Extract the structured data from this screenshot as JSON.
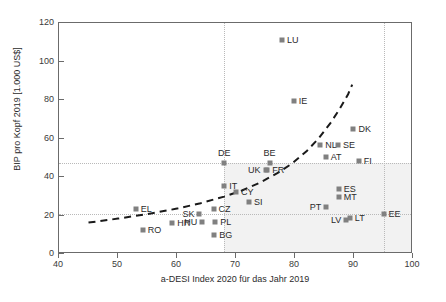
{
  "chart_data": {
    "type": "scatter",
    "title": "",
    "xlabel": "a-DESI Index 2020 für das Jahr 2019",
    "ylabel": "BIP pro Kopf 2019 [1.000 US$]",
    "xlim": [
      40,
      100
    ],
    "ylim": [
      0,
      120
    ],
    "xticks": [
      40,
      50,
      60,
      70,
      80,
      90,
      100
    ],
    "yticks": [
      0,
      20,
      40,
      60,
      80,
      100,
      120
    ],
    "grid": "dotted reference lines at x=68, x=95, y=21, y=47.5",
    "legend": "none",
    "marker_color": "#808080",
    "points": [
      {
        "label": "EL",
        "x": 53.0,
        "y": 23.5,
        "lx": 1,
        "ly": 0,
        "anchor": "right"
      },
      {
        "label": "RO",
        "x": 54.2,
        "y": 12.5,
        "lx": 1,
        "ly": 0,
        "anchor": "right"
      },
      {
        "label": "HR",
        "x": 59.2,
        "y": 16.0,
        "lx": 1,
        "ly": 0,
        "anchor": "right"
      },
      {
        "label": "SK",
        "x": 63.8,
        "y": 20.8,
        "lx": -1,
        "ly": 0,
        "anchor": "left"
      },
      {
        "label": "HU",
        "x": 64.3,
        "y": 16.8,
        "lx": -1,
        "ly": 0,
        "anchor": "left"
      },
      {
        "label": "CZ",
        "x": 66.2,
        "y": 23.5,
        "lx": 1,
        "ly": 0,
        "anchor": "right"
      },
      {
        "label": "PL",
        "x": 66.5,
        "y": 16.8,
        "lx": 1,
        "ly": 0,
        "anchor": "right"
      },
      {
        "label": "BG",
        "x": 66.3,
        "y": 9.8,
        "lx": 1,
        "ly": 0,
        "anchor": "right"
      },
      {
        "label": "DE",
        "x": 68.0,
        "y": 47.5,
        "lx": 0,
        "ly": -1,
        "anchor": "above"
      },
      {
        "label": "IT",
        "x": 68.0,
        "y": 35.5,
        "lx": 1,
        "ly": 0,
        "anchor": "right"
      },
      {
        "label": "CY",
        "x": 70.0,
        "y": 32.0,
        "lx": 1,
        "ly": 0,
        "anchor": "right"
      },
      {
        "label": "SI",
        "x": 72.2,
        "y": 27.0,
        "lx": 1,
        "ly": 0,
        "anchor": "right"
      },
      {
        "label": "UK",
        "x": 75.0,
        "y": 43.5,
        "lx": -1,
        "ly": 0,
        "anchor": "left"
      },
      {
        "label": "FR",
        "x": 75.3,
        "y": 43.5,
        "lx": 1,
        "ly": 0,
        "anchor": "right"
      },
      {
        "label": "BE",
        "x": 75.7,
        "y": 47.5,
        "lx": 0,
        "ly": -1,
        "anchor": "above"
      },
      {
        "label": "LU",
        "x": 77.8,
        "y": 111.0,
        "lx": 1,
        "ly": 0,
        "anchor": "right"
      },
      {
        "label": "IE",
        "x": 79.8,
        "y": 79.5,
        "lx": 1,
        "ly": 0,
        "anchor": "right"
      },
      {
        "label": "NL",
        "x": 84.3,
        "y": 56.5,
        "lx": 1,
        "ly": 0,
        "anchor": "right"
      },
      {
        "label": "AT",
        "x": 85.2,
        "y": 50.5,
        "lx": 1,
        "ly": 0,
        "anchor": "right"
      },
      {
        "label": "PT",
        "x": 85.3,
        "y": 24.5,
        "lx": -1,
        "ly": 0,
        "anchor": "left"
      },
      {
        "label": "SE",
        "x": 87.3,
        "y": 56.5,
        "lx": 1,
        "ly": 0,
        "anchor": "right"
      },
      {
        "label": "ES",
        "x": 87.4,
        "y": 34.0,
        "lx": 1,
        "ly": 0,
        "anchor": "right"
      },
      {
        "label": "MT",
        "x": 87.4,
        "y": 29.5,
        "lx": 1,
        "ly": 0,
        "anchor": "right"
      },
      {
        "label": "LV",
        "x": 88.7,
        "y": 17.5,
        "lx": -1,
        "ly": 0,
        "anchor": "left"
      },
      {
        "label": "LT",
        "x": 89.3,
        "y": 18.5,
        "lx": 1,
        "ly": 0,
        "anchor": "right"
      },
      {
        "label": "DK",
        "x": 89.9,
        "y": 65.0,
        "lx": 1,
        "ly": 0,
        "anchor": "right"
      },
      {
        "label": "FI",
        "x": 90.8,
        "y": 48.5,
        "lx": 1,
        "ly": 0,
        "anchor": "right"
      },
      {
        "label": "EE",
        "x": 95.0,
        "y": 21.0,
        "lx": 1,
        "ly": 0,
        "anchor": "right"
      }
    ],
    "trendline": {
      "style": "dashed",
      "color": "#1a1a1a",
      "points": [
        [
          45.0,
          16.3
        ],
        [
          50.0,
          18.4
        ],
        [
          55.0,
          20.8
        ],
        [
          60.0,
          23.6
        ],
        [
          64.0,
          26.4
        ],
        [
          68.0,
          29.8
        ],
        [
          71.0,
          33.0
        ],
        [
          74.0,
          37.0
        ],
        [
          77.0,
          42.0
        ],
        [
          79.5,
          47.0
        ],
        [
          82.0,
          53.5
        ],
        [
          84.0,
          60.0
        ],
        [
          86.0,
          68.0
        ],
        [
          87.5,
          75.0
        ],
        [
          89.0,
          83.0
        ],
        [
          89.7,
          88.0
        ]
      ]
    },
    "reference_lines": {
      "vertical": [
        68.0,
        95.0
      ],
      "horizontal": [
        47.5,
        21.0
      ]
    },
    "shaded_region": {
      "x0": 68.0,
      "x1": 100.0,
      "y0": 0,
      "y1": 47.5
    }
  }
}
